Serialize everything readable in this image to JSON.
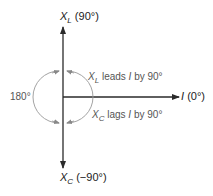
{
  "diagram": {
    "axes": {
      "up": {
        "symbol": "X",
        "subscript": "L",
        "angle": "(90°)"
      },
      "down": {
        "symbol": "X",
        "subscript": "C",
        "angle": "(−90°)"
      },
      "right": {
        "symbol": "I",
        "angle": "(0°)"
      }
    },
    "annotations": {
      "angle_between": "180°",
      "xl_leads": {
        "symbol": "X",
        "subscript": "L",
        "text": " leads ",
        "ref": "I",
        "tail": " by 90°"
      },
      "xc_lags": {
        "symbol": "X",
        "subscript": "C",
        "text": " lags ",
        "ref": "I",
        "tail": " by 90°"
      }
    },
    "colors": {
      "axis": "#2a2a2a",
      "arc": "#888888",
      "text": "#222222",
      "annotation_text": "#555555"
    }
  }
}
